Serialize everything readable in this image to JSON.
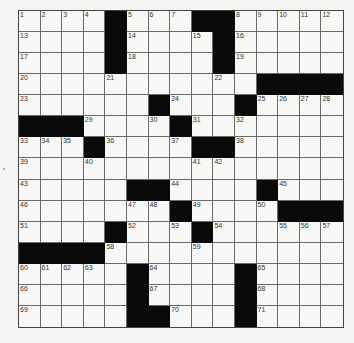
{
  "puzzle": {
    "rows": 15,
    "cols": 15,
    "layout": [
      "1,2,3,4,#,5,6,7,#,#,8,9,10,11,12",
      "13,.,.,.,#,14,.,.,15,#,16,.,.,.,.",
      "17,.,.,.,#,18,.,.,.,#,19,.,.,.,.",
      "20,.,.,.,21,.,.,.,.,22,.,#,#,#,#",
      "23,.,.,.,.,.,#,24,.,.,#,25,26,27,28",
      "#,#,#,29,.,.,30,#,31,.,32,.,.,.,.",
      "33,34,35,#,36,.,.,37,#,#,38,.,.,.,.",
      "39,.,.,40,.,.,.,.,41,42,.,.,.,.,.",
      "43,.,.,.,.,#,#,44,.,.,.,#,45,.,.",
      "46,.,.,.,.,47,48,#,49,.,.,50,#,#,#",
      "51,.,.,.,#,52,.,53,#,54,.,.,55,56,57",
      "#,#,#,#,58,.,.,.,59,.,.,.,.,.,.",
      "60,61,62,63,.,#,64,.,.,.,#,65,.,.,.",
      "66,.,.,.,.,#,67,.,.,.,#,68,.,.,.",
      "69,.,.,.,.,#,#,70,.,.,#,71,.,.,."
    ],
    "clue_numbers": [
      1,
      2,
      3,
      4,
      5,
      6,
      7,
      8,
      9,
      10,
      11,
      12,
      13,
      14,
      15,
      16,
      17,
      18,
      19,
      20,
      21,
      22,
      23,
      24,
      25,
      26,
      27,
      28,
      29,
      30,
      31,
      32,
      33,
      34,
      35,
      36,
      37,
      38,
      39,
      40,
      41,
      42,
      43,
      44,
      45,
      46,
      47,
      48,
      49,
      50,
      51,
      52,
      53,
      54,
      55,
      56,
      57,
      58,
      59,
      60,
      61,
      62,
      63,
      64,
      65,
      66,
      67,
      68,
      69,
      70,
      71
    ],
    "cell_values": "all empty"
  },
  "colors": {
    "block": "#0a0a0a",
    "cell": "#f8f8f6",
    "gridline": "#6a6a6a",
    "page": "#f4f4f2"
  }
}
